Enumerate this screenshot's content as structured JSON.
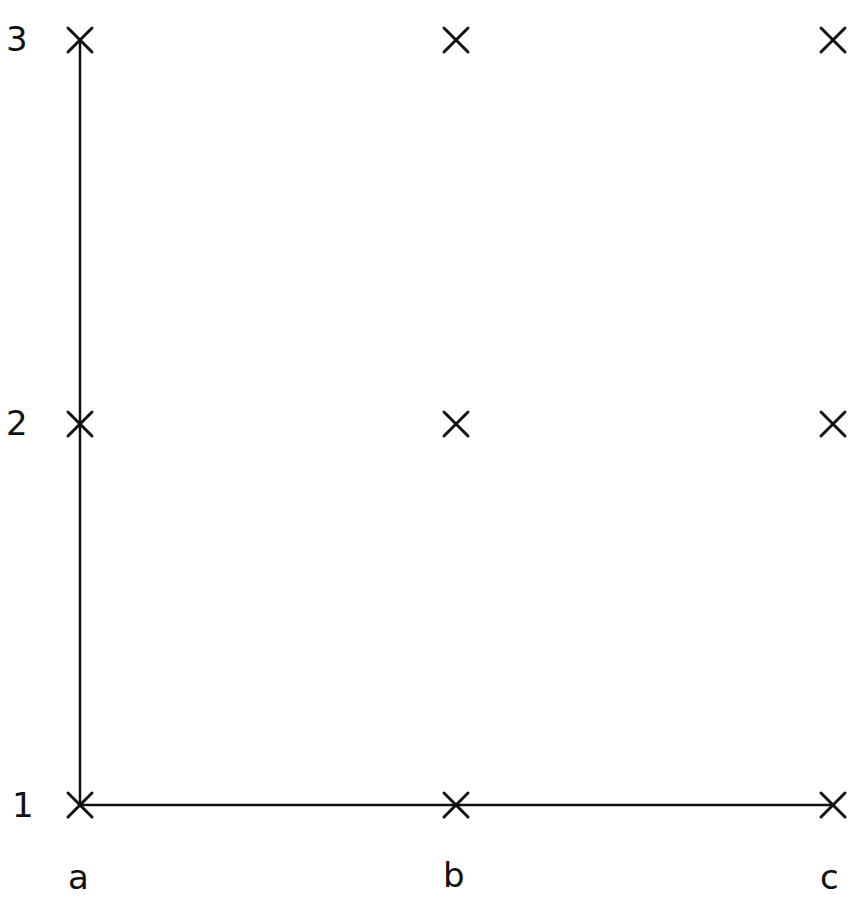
{
  "diagram": {
    "row_labels": [
      "1",
      "2",
      "3"
    ],
    "col_labels": [
      "a",
      "b",
      "c"
    ],
    "marker_symbol": "X",
    "points": [
      {
        "col": "a",
        "row": "1"
      },
      {
        "col": "b",
        "row": "1"
      },
      {
        "col": "c",
        "row": "1"
      },
      {
        "col": "a",
        "row": "2"
      },
      {
        "col": "b",
        "row": "2"
      },
      {
        "col": "c",
        "row": "2"
      },
      {
        "col": "a",
        "row": "3"
      },
      {
        "col": "b",
        "row": "3"
      },
      {
        "col": "c",
        "row": "3"
      }
    ],
    "lines": [
      {
        "from": {
          "col": "a",
          "row": "1"
        },
        "to": {
          "col": "a",
          "row": "3"
        },
        "label": "vertical-axis"
      },
      {
        "from": {
          "col": "a",
          "row": "1"
        },
        "to": {
          "col": "c",
          "row": "1"
        },
        "label": "horizontal-axis"
      }
    ],
    "stroke_color": "#111111",
    "background": "#ffffff"
  }
}
